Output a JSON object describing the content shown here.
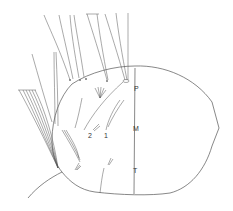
{
  "figure": {
    "type": "scientific line drawing",
    "colors": {
      "line": "#555555",
      "background": "#ffffff"
    },
    "labels": {
      "p": "P",
      "m": "M",
      "t": "T",
      "seta_1": "1",
      "seta_2": "2"
    }
  }
}
